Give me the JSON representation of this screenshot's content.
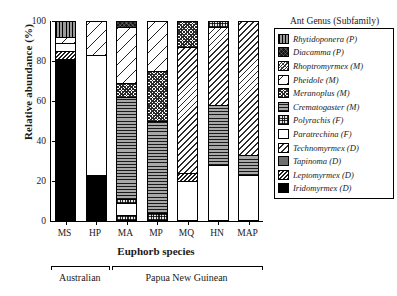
{
  "axes": {
    "ylabel": "Relative abundance (%)",
    "yticks": [
      "0",
      "20",
      "40",
      "60",
      "80",
      "100"
    ],
    "ytick_values": [
      0,
      20,
      40,
      60,
      80,
      100
    ],
    "xlabel": "Euphorb species",
    "xticks": [
      "MS",
      "HP",
      "MA",
      "MP",
      "MQ",
      "HN",
      "MAP"
    ]
  },
  "groups": [
    {
      "label": "Australian",
      "members": [
        "MS",
        "HP"
      ]
    },
    {
      "label": "Papua New Guinean",
      "members": [
        "MA",
        "MP",
        "MQ",
        "HN",
        "MAP"
      ]
    }
  ],
  "legend": {
    "title": "Ant Genus (Subfamily)",
    "items": [
      {
        "label": "Rhytidoponera (P)",
        "key": "rhytidoponera"
      },
      {
        "label": "Diacamma (P)",
        "key": "diacamma"
      },
      {
        "label": "Rhoptromyrmex (M)",
        "key": "rhoptromyrmex"
      },
      {
        "label": "Pheidole (M)",
        "key": "pheidole"
      },
      {
        "label": "Meranoplus (M)",
        "key": "meranoplus"
      },
      {
        "label": "Crematogaster (M)",
        "key": "crematogaster"
      },
      {
        "label": "Polyrachis (F)",
        "key": "polyrachis"
      },
      {
        "label": "Paratrechina (F)",
        "key": "paratrechina"
      },
      {
        "label": "Technomyrmex (D)",
        "key": "technomyrmex"
      },
      {
        "label": "Tapinoma (D)",
        "key": "tapinoma"
      },
      {
        "label": "Leptomyrmex (D)",
        "key": "leptomyrmex"
      },
      {
        "label": "Iridomyrmex (D)",
        "key": "iridomyrmex"
      }
    ]
  },
  "chart_data": {
    "type": "bar",
    "subtype": "stacked-100-percent",
    "title": "",
    "xlabel": "Euphorb species",
    "ylabel": "Relative abundance (%)",
    "ylim": [
      0,
      100
    ],
    "grid": false,
    "legend_position": "right",
    "legend_title": "Ant Genus (Subfamily)",
    "categories": [
      "MS",
      "HP",
      "MA",
      "MP",
      "MQ",
      "HN",
      "MAP"
    ],
    "series": [
      {
        "name": "Rhytidoponera (P)",
        "key": "rhytidoponera",
        "values": [
          10,
          0,
          0,
          0,
          0,
          0,
          0
        ]
      },
      {
        "name": "Diacamma (P)",
        "key": "diacamma",
        "values": [
          0,
          0,
          2,
          0,
          0,
          0,
          0
        ]
      },
      {
        "name": "Rhoptromyrmex (M)",
        "key": "rhoptromyrmex",
        "values": [
          0,
          0,
          0,
          0,
          0,
          0,
          0
        ]
      },
      {
        "name": "Pheidole (M)",
        "key": "pheidole",
        "values": [
          3,
          17,
          30,
          24,
          0,
          0,
          0
        ]
      },
      {
        "name": "Meranoplus (M)",
        "key": "meranoplus",
        "values": [
          0,
          0,
          0,
          24,
          13,
          0,
          0
        ]
      },
      {
        "name": "Crematogaster (M)",
        "key": "crematogaster",
        "values": [
          0,
          0,
          0,
          0,
          0,
          0,
          0
        ]
      },
      {
        "name": "Polyrachis (F)",
        "key": "polyrachis",
        "values": [
          0,
          0,
          0,
          0,
          0,
          2,
          0
        ]
      },
      {
        "name": "Paratrechina (F)",
        "key": "paratrechina",
        "values": [
          4,
          60,
          0,
          0,
          0,
          0,
          0
        ]
      },
      {
        "name": "Technomyrmex (D)",
        "key": "technomyrmex",
        "values": [
          0,
          0,
          0,
          0,
          61,
          40,
          87
        ]
      },
      {
        "name": "Tapinoma (D)",
        "key": "tapinoma",
        "values": [
          0,
          0,
          0,
          0,
          0,
          0,
          0
        ]
      },
      {
        "name": "Leptomyrmex (D)",
        "key": "leptomyrmex",
        "values": [
          2,
          0,
          4,
          0,
          3,
          0,
          0
        ]
      },
      {
        "name": "Iridomyrmex (D)",
        "key": "iridomyrmex",
        "values": [
          81,
          23,
          0,
          0,
          0,
          0,
          0
        ]
      }
    ],
    "bars": [
      {
        "category": "MS",
        "segments": [
          {
            "key": "iridomyrmex",
            "label": "Iridomyrmex (D)",
            "value": 81,
            "from": 0,
            "to": 81
          },
          {
            "key": "leptomyrmex",
            "label": "Leptomyrmex (D)",
            "value": 4,
            "from": 81,
            "to": 85
          },
          {
            "key": "paratrechina",
            "label": "Paratrechina (F)",
            "value": 4,
            "from": 85,
            "to": 89
          },
          {
            "key": "pheidole",
            "label": "Pheidole (M)",
            "value": 3,
            "from": 89,
            "to": 92
          },
          {
            "key": "rhytidoponera",
            "label": "Rhytidoponera (P)",
            "value": 8,
            "from": 92,
            "to": 100
          }
        ]
      },
      {
        "category": "HP",
        "segments": [
          {
            "key": "iridomyrmex",
            "label": "Iridomyrmex (D)",
            "value": 23,
            "from": 0,
            "to": 23
          },
          {
            "key": "paratrechina",
            "label": "Paratrechina (F)",
            "value": 60,
            "from": 23,
            "to": 83
          },
          {
            "key": "pheidole",
            "label": "Pheidole (M)",
            "value": 17,
            "from": 83,
            "to": 100
          }
        ]
      },
      {
        "category": "MA",
        "segments": [
          {
            "key": "polyrachis",
            "label": "Polyrachis (F)",
            "value": 3,
            "from": 0,
            "to": 3
          },
          {
            "key": "paratrechina",
            "label": "Paratrechina (F)",
            "value": 6,
            "from": 3,
            "to": 9
          },
          {
            "key": "polyrachis",
            "label": "Polyrachis (F)",
            "value": 2,
            "from": 9,
            "to": 11
          },
          {
            "key": "crematogaster",
            "label": "Crematogaster (M)",
            "value": 51,
            "from": 11,
            "to": 62
          },
          {
            "key": "meranoplus",
            "label": "Meranoplus (M)",
            "value": 7,
            "from": 62,
            "to": 69
          },
          {
            "key": "pheidole",
            "label": "Pheidole (M)",
            "value": 28,
            "from": 69,
            "to": 97
          },
          {
            "key": "diacamma",
            "label": "Diacamma (P)",
            "value": 3,
            "from": 97,
            "to": 100
          }
        ]
      },
      {
        "category": "MP",
        "segments": [
          {
            "key": "polyrachis",
            "label": "Polyrachis (F)",
            "value": 4,
            "from": 0,
            "to": 4
          },
          {
            "key": "crematogaster",
            "label": "Crematogaster (M)",
            "value": 46,
            "from": 4,
            "to": 50
          },
          {
            "key": "meranoplus",
            "label": "Meranoplus (M)",
            "value": 25,
            "from": 50,
            "to": 75
          },
          {
            "key": "pheidole",
            "label": "Pheidole (M)",
            "value": 25,
            "from": 75,
            "to": 100
          }
        ]
      },
      {
        "category": "MQ",
        "segments": [
          {
            "key": "paratrechina",
            "label": "Paratrechina (F)",
            "value": 20,
            "from": 0,
            "to": 20
          },
          {
            "key": "leptomyrmex",
            "label": "Leptomyrmex (D)",
            "value": 4,
            "from": 20,
            "to": 24
          },
          {
            "key": "technomyrmex",
            "label": "Technomyrmex (D)",
            "value": 63,
            "from": 24,
            "to": 87
          },
          {
            "key": "meranoplus",
            "label": "Meranoplus (M)",
            "value": 13,
            "from": 87,
            "to": 100
          }
        ]
      },
      {
        "category": "HN",
        "segments": [
          {
            "key": "paratrechina",
            "label": "Paratrechina (F)",
            "value": 28,
            "from": 0,
            "to": 28
          },
          {
            "key": "crematogaster",
            "label": "Crematogaster (M)",
            "value": 30,
            "from": 28,
            "to": 58
          },
          {
            "key": "technomyrmex",
            "label": "Technomyrmex (D)",
            "value": 39,
            "from": 58,
            "to": 97
          },
          {
            "key": "polyrachis",
            "label": "Polyrachis (F)",
            "value": 3,
            "from": 97,
            "to": 100
          }
        ]
      },
      {
        "category": "MAP",
        "segments": [
          {
            "key": "paratrechina",
            "label": "Paratrechina (F)",
            "value": 23,
            "from": 0,
            "to": 23
          },
          {
            "key": "crematogaster",
            "label": "Crematogaster (M)",
            "value": 10,
            "from": 23,
            "to": 33
          },
          {
            "key": "technomyrmex",
            "label": "Technomyrmex (D)",
            "value": 67,
            "from": 33,
            "to": 100
          }
        ]
      }
    ]
  }
}
